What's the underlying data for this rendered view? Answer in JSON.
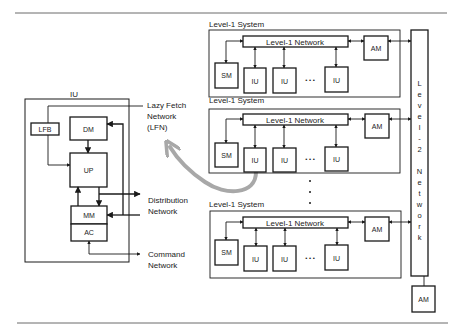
{
  "iu_detail": {
    "title": "IU",
    "blocks": {
      "lfb": "LFB",
      "dm": "DM",
      "up": "UP",
      "mm": "MM",
      "ac": "AC"
    },
    "networks": {
      "lfn_line1": "Lazy  Fetch",
      "lfn_line2": "Network",
      "lfn_line3": "(LFN)",
      "dist_line1": "Distribution",
      "dist_line2": "Network",
      "cmd_line1": "Command",
      "cmd_line2": "Network"
    }
  },
  "level1_systems": [
    {
      "label": "Level-1  System",
      "network": "Level-1  Network",
      "sm": "SM",
      "am": "AM",
      "ius": [
        "IU",
        "IU",
        "IU"
      ],
      "ellipsis": "• • •"
    },
    {
      "label": "Level-1  System",
      "network": "Level-1  Network",
      "sm": "SM",
      "am": "AM",
      "ius": [
        "IU",
        "IU",
        "IU"
      ],
      "ellipsis": "• • •"
    },
    {
      "label": "Level-1  System",
      "network": "Level-1  Network",
      "sm": "SM",
      "am": "AM",
      "ius": [
        "IU",
        "IU",
        "IU"
      ],
      "ellipsis": "• • •"
    }
  ],
  "level2": {
    "letters": [
      "L",
      "e",
      "v",
      "e",
      "l",
      "-",
      "2",
      "",
      "N",
      "e",
      "t",
      "w",
      "o",
      "r",
      "k"
    ],
    "am": "AM"
  },
  "colors": {
    "line": "#1a1a1a",
    "highlight_arrow": "#a8a8a8",
    "rule": "#6b6b6b"
  }
}
